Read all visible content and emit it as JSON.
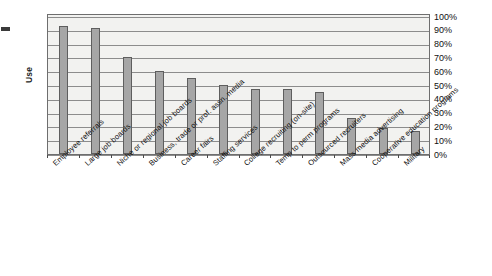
{
  "chart_data": {
    "type": "bar",
    "title": "",
    "xlabel": "",
    "ylabel": "Use",
    "ylim": [
      0,
      100
    ],
    "ytick_labels": [
      "100%",
      "90%",
      "80%",
      "70%",
      "60%",
      "50%",
      "40%",
      "30%",
      "20%",
      "10%",
      "0%"
    ],
    "ytick_values": [
      100,
      90,
      80,
      70,
      60,
      50,
      40,
      30,
      20,
      10,
      0
    ],
    "grid": true,
    "legend": "none",
    "value_suffix": "%",
    "categories": [
      "Employee referrals",
      "Large job boards",
      "Niche or regional job boards",
      "Business, trade or prof. assn. media",
      "Career fairs",
      "Staffing services",
      "College recruiting (on-site)",
      "Temp to perm programs",
      "Outsourced recruiters",
      "Mass media advertising",
      "Cooperative education programs",
      "Military"
    ],
    "values": [
      93,
      91,
      70,
      60,
      55,
      50,
      47,
      47,
      45,
      26,
      19,
      17
    ],
    "bar_color": "#a6a6a6",
    "bar_border_color": "#5e5e5e",
    "plot_background": "#f2f2f0",
    "grid_color": "#8c8c8c",
    "axis_color": "#6e6e6e"
  }
}
